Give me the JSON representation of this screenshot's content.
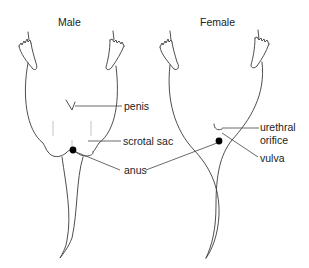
{
  "diagram": {
    "panels": [
      {
        "title": "Male",
        "labels": {
          "penis": "penis",
          "scrotal_sac": "scrotal sac",
          "anus": "anus"
        }
      },
      {
        "title": "Female",
        "labels": {
          "urethral_orifice_line1": "urethral",
          "urethral_orifice_line2": "orifice",
          "vulva": "vulva"
        }
      }
    ],
    "colors": {
      "line": "#3a3a3a",
      "text": "#222222",
      "background": "#ffffff"
    }
  }
}
